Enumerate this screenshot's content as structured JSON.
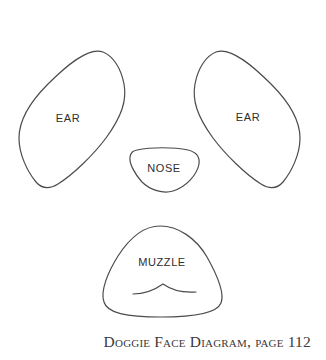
{
  "diagram": {
    "caption": "Doggie Face Diagram, page 112",
    "labels": {
      "ear_left": "EAR",
      "ear_right": "EAR",
      "nose": "NOSE",
      "muzzle": "MUZZLE"
    },
    "colors": {
      "background": "#ffffff",
      "outline": "#4b4b4b",
      "label": "#2e2e2e",
      "caption": "#3a3a3a"
    }
  }
}
